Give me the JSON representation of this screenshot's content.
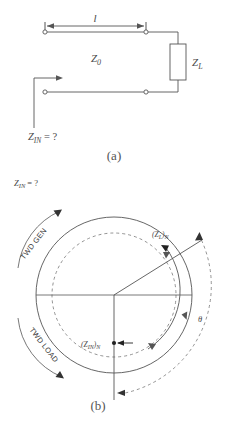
{
  "figure": {
    "panel_a": {
      "caption": "(a)",
      "length_label": "l",
      "line_impedance_label": "Z",
      "line_impedance_sub": "0",
      "load_label": "Z",
      "load_sub": "L",
      "input_label": "Z",
      "input_sub": "IN",
      "input_value": "= ?"
    },
    "panel_b": {
      "caption": "(b)",
      "input_label": "Z",
      "input_sub": "IN",
      "input_value": "= ?",
      "toward_generator_label": "TWD GEN",
      "toward_load_label": "TWD LOAD",
      "load_point_label": "(Z",
      "load_point_sub": "L",
      "load_point_suffix": ")",
      "load_point_norm": "N",
      "input_point_label": "(Z",
      "input_point_sub": "IN",
      "input_point_suffix": ")",
      "input_point_norm": "N",
      "angle_label": "θ"
    }
  },
  "colors": {
    "stroke": "#555555",
    "text": "#4a4a4a",
    "background": "#ffffff"
  }
}
